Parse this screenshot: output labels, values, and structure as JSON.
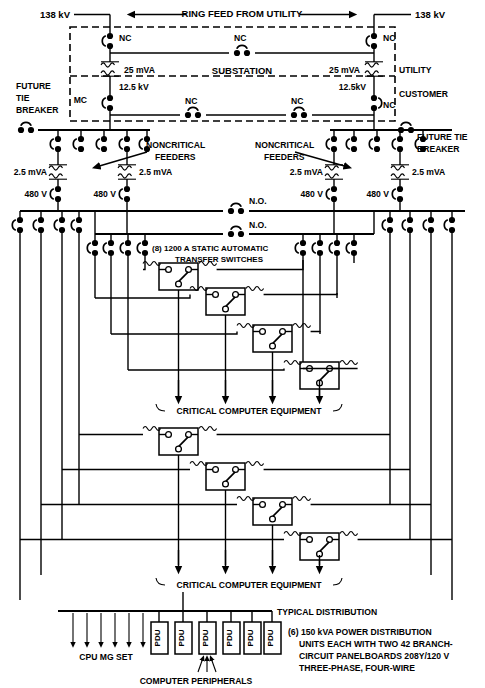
{
  "diagram": {
    "canvas": {
      "width": 485,
      "height": 688
    },
    "colors": {
      "line": "#000000",
      "background": "#ffffff"
    }
  },
  "labels": {
    "kv_left": "138 kV",
    "kv_right": "138 kV",
    "ring_feed": "RING FEED FROM UTILITY",
    "substation": "SUBSTATION",
    "utility": "UTILITY",
    "customer": "CUSTOMER",
    "nc": "NC",
    "no": "N.O.",
    "mc": "MC",
    "mva_25_left": "25 mVA",
    "mva_25_right": "25 mVA",
    "kv_125_left": "12.5 kV",
    "kv_125_right": "12.5kV",
    "future_tie_breaker_l1": "FUTURE",
    "future_tie_breaker_l2": "TIE",
    "future_tie_breaker_l3": "BREAKER",
    "future_tie_breaker_r1": "FUTURE TIE",
    "future_tie_breaker_r2": "BREAKER",
    "noncritical_l1": "NONCRITICAL",
    "noncritical_l2": "FEEDERS",
    "mva_25_a": "2.5 mVA",
    "mva_25_b": "2.5 mVA",
    "mva_25_c": "2.5 mVA",
    "mva_25_d": "2.5 mVA",
    "volt_480_a": "480 V",
    "volt_480_b": "480 V",
    "volt_480_c": "480 V",
    "volt_480_d": "480 V",
    "ats_l1": "(8) 1200 A STATIC AUTOMATIC",
    "ats_l2": "TRANSFER SWITCHES",
    "critical_upper": "CRITICAL COMPUTER EQUIPMENT",
    "critical_lower": "CRITICAL COMPUTER EQUIPMENT",
    "typical_distribution": "TYPICAL DISTRIBUTION",
    "cpu_mg_set": "CPU  MG  SET",
    "pdu": "PDU",
    "computer_peripherals": "COMPUTER  PERIPHERALS",
    "note_l1": "(6) 150 kVA POWER DISTRIBUTION",
    "note_l2": "UNITS EACH WITH TWO 42 BRANCH-",
    "note_l3": "CIRCUIT PANELBOARDS 208Y/120 V",
    "note_l4": "THREE-PHASE, FOUR-WIRE"
  },
  "components": {
    "transformers_25mva": 2,
    "transformers_2_5mva": 4,
    "transfer_switches_count": 8,
    "pdu_count": 6,
    "cpu_mg_set_arrows": 6,
    "peripheral_arrows": 3,
    "critical_feeds_upper": 4,
    "critical_feeds_lower": 4,
    "nc_breakers_hv": 4,
    "nc_breakers_mv": 4,
    "no_ties": 2
  }
}
